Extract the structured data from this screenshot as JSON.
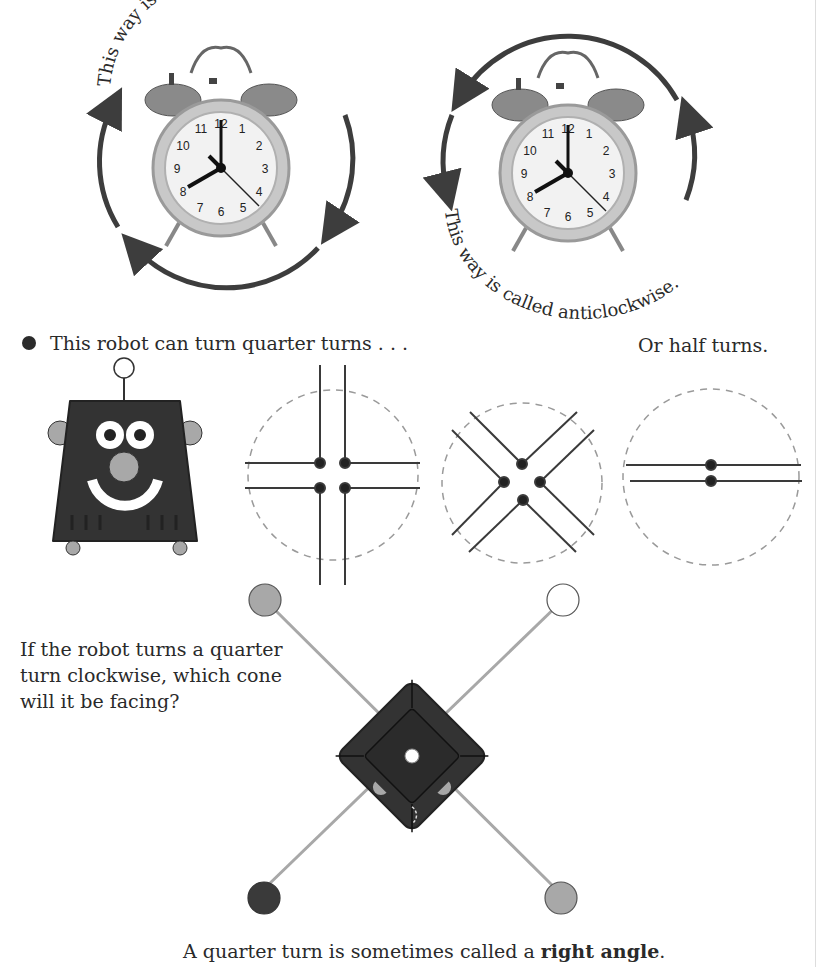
{
  "top_cropped_text": "",
  "clocks": [
    {
      "id": "clockwise",
      "caption": "This way is called clockwise.",
      "direction": "clockwise",
      "time_shown": "8:00",
      "numerals": [
        "12",
        "1",
        "2",
        "3",
        "4",
        "5",
        "6",
        "7",
        "8",
        "9",
        "10",
        "11"
      ]
    },
    {
      "id": "anticlockwise",
      "caption": "This way is called anticlockwise.",
      "direction": "anticlockwise",
      "time_shown": "8:00",
      "numerals": [
        "12",
        "1",
        "2",
        "3",
        "4",
        "5",
        "6",
        "7",
        "8",
        "9",
        "10",
        "11"
      ]
    }
  ],
  "robot_section": {
    "intro": "This robot can turn quarter turns . . .",
    "half_turns_label": "Or half turns.",
    "diagrams": [
      {
        "name": "quarter-turns-plus",
        "type": "quarter",
        "orientation": "upright"
      },
      {
        "name": "quarter-turns-x",
        "type": "quarter",
        "orientation": "diagonal"
      },
      {
        "name": "half-turns",
        "type": "half",
        "orientation": "horizontal"
      }
    ]
  },
  "question": {
    "text": "If the robot turns a quarter turn clockwise, which cone will it be facing?",
    "cones": [
      {
        "position": "top-left",
        "color": "#a8a8a8"
      },
      {
        "position": "top-right",
        "color": "#ffffff"
      },
      {
        "position": "bottom-left",
        "color": "#3a3a3a"
      },
      {
        "position": "bottom-right",
        "color": "#a8a8a8"
      }
    ]
  },
  "footer": {
    "prefix": "A quarter turn is sometimes called a ",
    "bold": "right angle",
    "suffix": "."
  },
  "colors": {
    "arrow": "#3d3d3d",
    "robot_body": "#333333",
    "robot_grey": "#a8a8a8",
    "dashed": "#9a9a9a",
    "line": "#3a3a3a"
  }
}
